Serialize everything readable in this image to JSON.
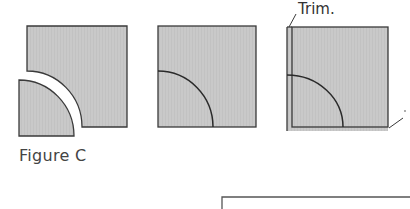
{
  "figure": {
    "caption": "Figure C",
    "trim_label": "Trim.",
    "colors": {
      "fill": "#c8c8c8",
      "stroke": "#3a3a3a",
      "background": "#ffffff"
    },
    "panels": [
      {
        "name": "separated-block",
        "description": "Square block with quarter-circle cut away and the quarter-circle piece offset"
      },
      {
        "name": "joined-block",
        "description": "Square block with quarter-circle sewn in place"
      },
      {
        "name": "trimmed-block",
        "description": "Joined block with trim lines on left and bottom edges"
      }
    ]
  }
}
